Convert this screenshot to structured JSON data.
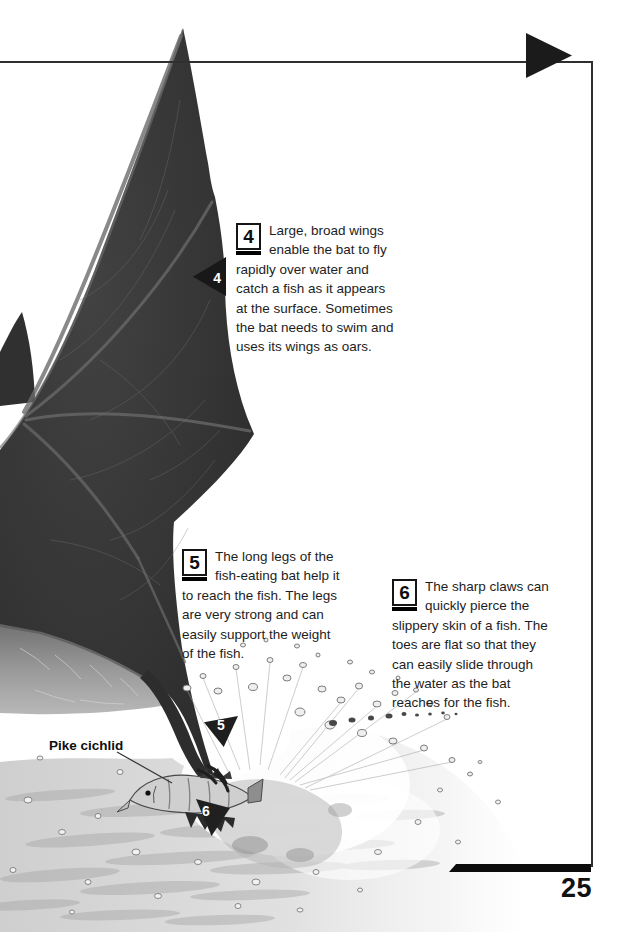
{
  "page": {
    "number": "25",
    "background": "#ffffff",
    "frame_color": "#2f2f2f",
    "ink_color": "#111111"
  },
  "callouts": [
    {
      "number": "4",
      "lines": [
        "Large, broad wings",
        "enable the bat to fly",
        "rapidly over water and",
        "catch a fish as it appears",
        "at the surface. Sometimes",
        "the bat needs to swim and",
        "uses its wings as oars."
      ]
    },
    {
      "number": "5",
      "lines": [
        "The long legs of the",
        "fish-eating bat help it",
        "to reach the fish. The legs",
        "are very strong and can",
        "easily support the weight",
        "of the fish."
      ]
    },
    {
      "number": "6",
      "lines": [
        "The sharp claws can",
        "quickly pierce the",
        "slippery skin of a fish. The",
        "toes are flat so that they",
        "can easily slide through",
        "the water as the bat",
        "reaches for the fish."
      ]
    }
  ],
  "markers": [
    {
      "number": "4"
    },
    {
      "number": "5"
    },
    {
      "number": "6"
    }
  ],
  "labels": {
    "fish": "Pike cichlid"
  }
}
